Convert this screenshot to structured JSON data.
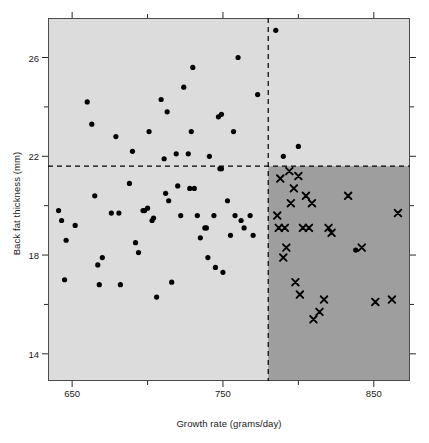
{
  "chart_data": {
    "type": "scatter",
    "title": "",
    "xlabel": "Growth rate (grams/day)",
    "ylabel": "Back fat thickness (mm)",
    "xlim": [
      634,
      874
    ],
    "ylim": [
      12.9,
      27.6
    ],
    "xticks": [
      650,
      750,
      850
    ],
    "xtick_labels": [
      "650",
      "750",
      "850"
    ],
    "x_minor_ticks": [
      700,
      800
    ],
    "yticks": [
      14,
      18,
      22,
      26
    ],
    "ytick_labels": [
      "14",
      "18",
      "22",
      "26"
    ],
    "y_minor_ticks": [
      16,
      20,
      24
    ],
    "grid": false,
    "legend": null,
    "background_color": "#dcdcdc",
    "highlight_region_color": "#9e9e9e",
    "marker_color": "#000000",
    "threshold_lines": {
      "vertical_x": 780,
      "horizontal_y": 21.6,
      "style": "dashed",
      "color": "#000000"
    },
    "series": [
      {
        "name": "dots",
        "marker": "circle",
        "points": [
          [
            641,
            19.8
          ],
          [
            643,
            19.4
          ],
          [
            645,
            17.0
          ],
          [
            646,
            18.6
          ],
          [
            652,
            19.2
          ],
          [
            660,
            24.2
          ],
          [
            663,
            23.3
          ],
          [
            665,
            20.4
          ],
          [
            667,
            17.6
          ],
          [
            668,
            16.8
          ],
          [
            670,
            17.9
          ],
          [
            676,
            19.7
          ],
          [
            679,
            22.8
          ],
          [
            681,
            19.7
          ],
          [
            682,
            16.8
          ],
          [
            688,
            20.9
          ],
          [
            690,
            22.2
          ],
          [
            692,
            18.5
          ],
          [
            694,
            18.1
          ],
          [
            697,
            19.8
          ],
          [
            698,
            19.8
          ],
          [
            700,
            19.9
          ],
          [
            701,
            23.0
          ],
          [
            703,
            19.4
          ],
          [
            704,
            19.5
          ],
          [
            706,
            16.3
          ],
          [
            709,
            24.3
          ],
          [
            711,
            21.9
          ],
          [
            712,
            20.5
          ],
          [
            713,
            23.8
          ],
          [
            714,
            20.2
          ],
          [
            716,
            16.9
          ],
          [
            719,
            22.1
          ],
          [
            720,
            20.8
          ],
          [
            722,
            19.6
          ],
          [
            724,
            24.8
          ],
          [
            727,
            22.1
          ],
          [
            728,
            20.7
          ],
          [
            729,
            23.0
          ],
          [
            730,
            25.6
          ],
          [
            731,
            20.7
          ],
          [
            733,
            19.6
          ],
          [
            735,
            18.7
          ],
          [
            738,
            19.1
          ],
          [
            739,
            19.1
          ],
          [
            740,
            17.9
          ],
          [
            741,
            22.0
          ],
          [
            744,
            19.6
          ],
          [
            745,
            17.5
          ],
          [
            747,
            23.6
          ],
          [
            748,
            21.5
          ],
          [
            749,
            23.7
          ],
          [
            749,
            21.5
          ],
          [
            750,
            17.3
          ],
          [
            753,
            20.2
          ],
          [
            755,
            18.8
          ],
          [
            757,
            23.0
          ],
          [
            758,
            19.6
          ],
          [
            760,
            26.0
          ],
          [
            762,
            19.4
          ],
          [
            764,
            19.1
          ],
          [
            768,
            19.6
          ],
          [
            770,
            18.8
          ],
          [
            773,
            24.5
          ],
          [
            785,
            27.1
          ],
          [
            790,
            22.0
          ],
          [
            800,
            22.4
          ],
          [
            838,
            18.2
          ]
        ]
      },
      {
        "name": "crosses",
        "marker": "x",
        "points": [
          [
            786,
            19.6
          ],
          [
            787,
            19.1
          ],
          [
            788,
            21.1
          ],
          [
            790,
            17.9
          ],
          [
            791,
            19.1
          ],
          [
            792,
            18.3
          ],
          [
            794,
            21.4
          ],
          [
            795,
            20.1
          ],
          [
            797,
            20.7
          ],
          [
            798,
            16.9
          ],
          [
            800,
            21.2
          ],
          [
            801,
            16.4
          ],
          [
            803,
            19.1
          ],
          [
            805,
            20.4
          ],
          [
            807,
            19.1
          ],
          [
            809,
            20.1
          ],
          [
            810,
            15.4
          ],
          [
            814,
            15.7
          ],
          [
            817,
            16.2
          ],
          [
            820,
            19.1
          ],
          [
            822,
            18.9
          ],
          [
            833,
            20.4
          ],
          [
            842,
            18.3
          ],
          [
            851,
            16.1
          ],
          [
            862,
            16.2
          ],
          [
            866,
            19.7
          ]
        ]
      }
    ]
  }
}
